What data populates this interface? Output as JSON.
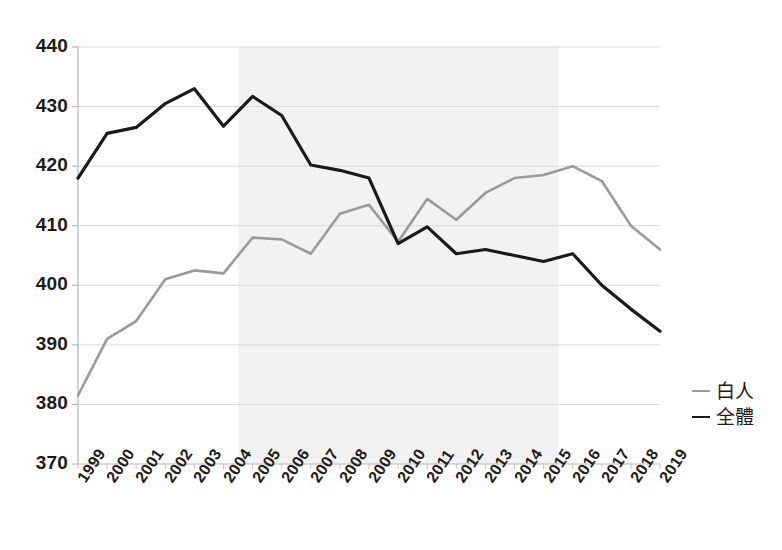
{
  "chart_data": {
    "type": "line",
    "title": "",
    "subtitle": "",
    "xlabel": "",
    "ylabel": "",
    "x": [
      1999,
      2000,
      2001,
      2002,
      2003,
      2004,
      2005,
      2006,
      2007,
      2008,
      2009,
      2010,
      2011,
      2012,
      2013,
      2014,
      2015,
      2016,
      2017,
      2018,
      2019
    ],
    "categories": [
      "1999",
      "2000",
      "2001",
      "2002",
      "2003",
      "2004",
      "2005",
      "2006",
      "2007",
      "2008",
      "2009",
      "2010",
      "2011",
      "2012",
      "2013",
      "2014",
      "2015",
      "2016",
      "2017",
      "2018",
      "2019"
    ],
    "series": [
      {
        "name": "白人",
        "color": "#9a9a9a",
        "values": [
          381.5,
          391.0,
          394.0,
          401.0,
          402.5,
          402.0,
          408.0,
          407.7,
          405.3,
          412.0,
          413.5,
          407.3,
          414.5,
          411.0,
          415.5,
          418.0,
          418.5,
          420.0,
          417.5,
          410.0,
          406.0
        ]
      },
      {
        "name": "全體",
        "color": "#1a1a1a",
        "values": [
          418.0,
          425.5,
          426.5,
          430.5,
          433.0,
          426.7,
          431.7,
          428.5,
          420.2,
          419.3,
          418.0,
          407.0,
          409.8,
          405.3,
          406.0,
          405.0,
          404.0,
          405.3,
          400.0,
          396.0,
          392.3
        ]
      }
    ],
    "ylim": [
      370,
      440
    ],
    "yticks": [
      370,
      380,
      390,
      400,
      410,
      420,
      430,
      440
    ],
    "ytick_labels": [
      "370",
      "380",
      "390",
      "400",
      "410",
      "420",
      "430",
      "440"
    ],
    "xlim": [
      1999,
      2019
    ],
    "grid": true,
    "grid_color": "#d9d9d9",
    "legend_position": "right",
    "legend": [
      {
        "label": "白人",
        "color": "#9a9a9a"
      },
      {
        "label": "全體",
        "color": "#1a1a1a"
      }
    ],
    "annotations": [
      {
        "type": "shaded-band",
        "x_start": 2004.5,
        "x_end": 2015.5,
        "color": "#f2f2f2",
        "label": ""
      }
    ]
  },
  "plot_geometry": {
    "left": 78,
    "right": 660,
    "top": 47,
    "bottom": 464
  }
}
